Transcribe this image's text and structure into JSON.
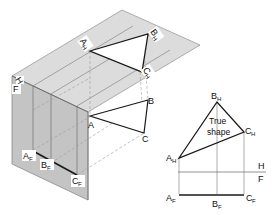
{
  "diagram": {
    "colors": {
      "horizontal_plane": "#dcdcdc",
      "horizontal_plane_edge": "#9a9a9a",
      "front_plane": "#c4c4c4",
      "front_plane_side": "#b2b2b2",
      "edge_line": "#1a1a1a",
      "projector": "#9a9a9a"
    },
    "pictorial": {
      "plane_labels": {
        "horizontal": "H",
        "front": "F"
      },
      "object_points": {
        "A": "A",
        "B": "B",
        "C": "C"
      },
      "horizontal_projection": {
        "A": "A",
        "B": "B",
        "C": "C",
        "sub": "H"
      },
      "front_projection": {
        "A": "A",
        "B": "B",
        "C": "C",
        "sub": "F"
      }
    },
    "orthographic": {
      "folding_line": {
        "upper": "H",
        "lower": "F"
      },
      "top_view": {
        "A": "A",
        "B": "B",
        "C": "C",
        "sub": "H"
      },
      "front_view": {
        "A": "A",
        "B": "B",
        "C": "C",
        "sub": "F"
      },
      "annotation": {
        "line1": "True",
        "line2": "shape"
      }
    }
  }
}
